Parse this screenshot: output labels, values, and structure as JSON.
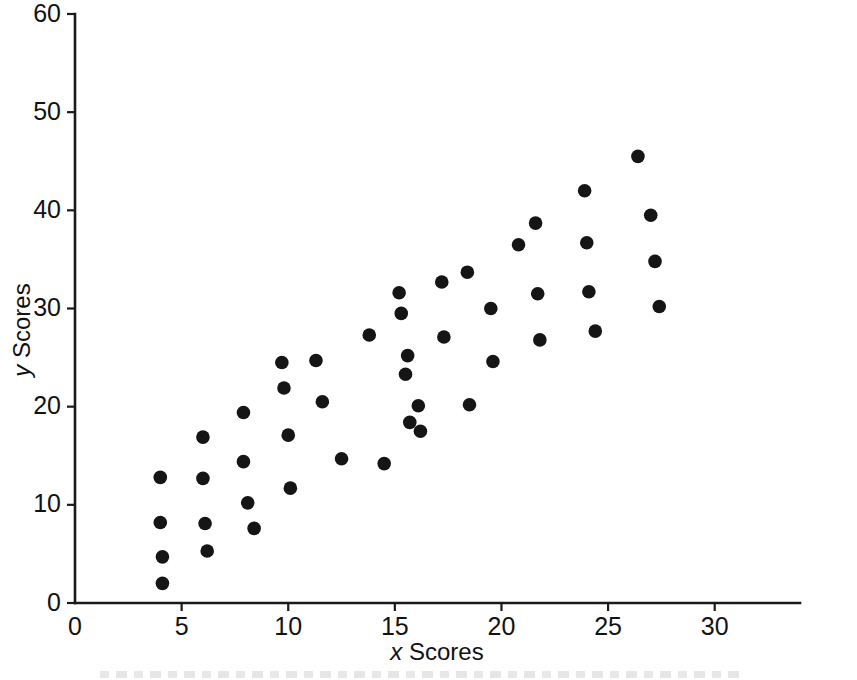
{
  "figure": {
    "background_color": "#ffffff",
    "marker_color": "#151515",
    "axis_color": "#1a1a1a",
    "caption_partial": ""
  },
  "axes": {
    "x_title_variable": "x",
    "x_title_text": " Scores",
    "y_title_variable": "y",
    "y_title_text": " Scores",
    "x_ticks": [
      "0",
      "5",
      "10",
      "15",
      "20",
      "25",
      "30"
    ],
    "y_ticks": [
      "0",
      "10",
      "20",
      "30",
      "40",
      "50",
      "60"
    ]
  },
  "chart_data": {
    "type": "scatter",
    "title": "",
    "xlabel": "x Scores",
    "ylabel": "y Scores",
    "xlim": [
      0,
      34
    ],
    "ylim": [
      0,
      60
    ],
    "xticks": [
      0,
      5,
      10,
      15,
      20,
      25,
      30
    ],
    "yticks": [
      0,
      10,
      20,
      30,
      40,
      50,
      60
    ],
    "grid": false,
    "legend": false,
    "marker": "filled-circle",
    "n_points": 50,
    "points": [
      {
        "x": 4.0,
        "y": 12.8
      },
      {
        "x": 4.0,
        "y": 8.2
      },
      {
        "x": 4.1,
        "y": 4.7
      },
      {
        "x": 4.1,
        "y": 2.0
      },
      {
        "x": 6.0,
        "y": 16.9
      },
      {
        "x": 6.0,
        "y": 12.7
      },
      {
        "x": 6.1,
        "y": 8.1
      },
      {
        "x": 6.2,
        "y": 5.3
      },
      {
        "x": 7.9,
        "y": 19.4
      },
      {
        "x": 7.9,
        "y": 14.4
      },
      {
        "x": 8.1,
        "y": 10.2
      },
      {
        "x": 8.4,
        "y": 7.6
      },
      {
        "x": 9.7,
        "y": 24.5
      },
      {
        "x": 9.8,
        "y": 21.9
      },
      {
        "x": 10.0,
        "y": 17.1
      },
      {
        "x": 10.1,
        "y": 11.7
      },
      {
        "x": 11.3,
        "y": 24.7
      },
      {
        "x": 11.6,
        "y": 20.5
      },
      {
        "x": 12.5,
        "y": 14.7
      },
      {
        "x": 13.8,
        "y": 27.3
      },
      {
        "x": 14.5,
        "y": 14.2
      },
      {
        "x": 15.2,
        "y": 31.6
      },
      {
        "x": 15.3,
        "y": 29.5
      },
      {
        "x": 15.5,
        "y": 23.3
      },
      {
        "x": 15.6,
        "y": 25.2
      },
      {
        "x": 15.7,
        "y": 18.4
      },
      {
        "x": 16.1,
        "y": 20.1
      },
      {
        "x": 16.2,
        "y": 17.5
      },
      {
        "x": 17.2,
        "y": 32.7
      },
      {
        "x": 17.3,
        "y": 27.1
      },
      {
        "x": 18.4,
        "y": 33.7
      },
      {
        "x": 18.5,
        "y": 20.2
      },
      {
        "x": 19.5,
        "y": 30.0
      },
      {
        "x": 19.6,
        "y": 24.6
      },
      {
        "x": 20.8,
        "y": 36.5
      },
      {
        "x": 21.6,
        "y": 38.7
      },
      {
        "x": 21.7,
        "y": 31.5
      },
      {
        "x": 21.8,
        "y": 26.8
      },
      {
        "x": 23.9,
        "y": 42.0
      },
      {
        "x": 24.0,
        "y": 36.7
      },
      {
        "x": 24.1,
        "y": 31.7
      },
      {
        "x": 24.4,
        "y": 27.7
      },
      {
        "x": 26.4,
        "y": 45.5
      },
      {
        "x": 27.0,
        "y": 39.5
      },
      {
        "x": 27.2,
        "y": 34.8
      },
      {
        "x": 27.4,
        "y": 30.2
      }
    ]
  }
}
